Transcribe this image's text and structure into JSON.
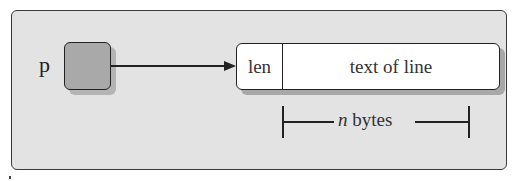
{
  "diagram": {
    "type": "pointer-to-record",
    "pointer": {
      "label": "p",
      "fill": "#a9a9a9"
    },
    "record": {
      "fields": [
        {
          "name": "len",
          "label": "len"
        },
        {
          "name": "text",
          "label": "text of line"
        }
      ],
      "fill": "#ffffff"
    },
    "size_annotation": {
      "variable": "n",
      "unit": " bytes",
      "spans_field": "text"
    },
    "colors": {
      "panel_bg": "#e3e3e3",
      "stroke": "#222222",
      "shadow": "#a8a8a8"
    }
  }
}
